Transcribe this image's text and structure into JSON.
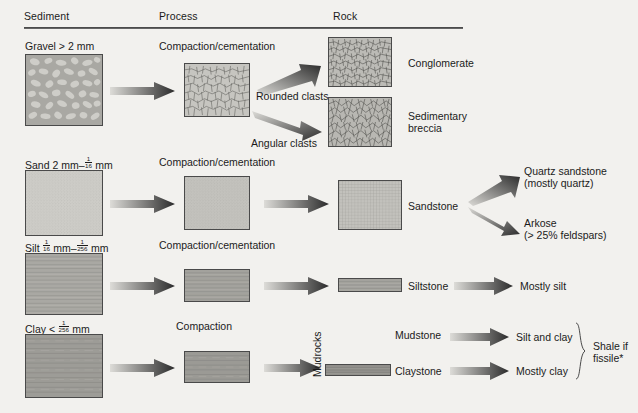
{
  "headers": [
    {
      "label": "Sediment"
    },
    {
      "label": "Process"
    },
    {
      "label": "Rock"
    }
  ],
  "rows": {
    "gravel": {
      "sediment_name": "Gravel",
      "sediment_size": "> 2 mm",
      "process": "Compaction/cementation",
      "branch_labels": [
        "Rounded clasts",
        "Angular clasts"
      ],
      "rocks": [
        "Conglomerate",
        "Sedimentary breccia"
      ]
    },
    "sand": {
      "sediment_name": "Sand",
      "sediment_size_pre": "2 mm–",
      "sediment_frac_num": "1",
      "sediment_frac_den": "16",
      "sediment_size_post": "mm",
      "process": "Compaction/cementation",
      "rock": "Sandstone",
      "products": [
        {
          "line1": "Quartz sandstone",
          "line2": "(mostly quartz)"
        },
        {
          "line1": "Arkose",
          "line2": "(> 25% feldspars)"
        }
      ]
    },
    "silt": {
      "sediment_name": "Silt",
      "frac1_num": "1",
      "frac1_den": "16",
      "mid": "mm–",
      "frac2_num": "1",
      "frac2_den": "256",
      "tail": "mm",
      "process": "Compaction/cementation",
      "rock": "Siltstone",
      "product": "Mostly silt"
    },
    "clay": {
      "sediment_name": "Clay",
      "lt": "<",
      "frac_num": "1",
      "frac_den": "256",
      "tail": "mm",
      "process": "Compaction",
      "rocks": [
        {
          "name": "Mudstone",
          "product": "Silt and clay"
        },
        {
          "name": "Claystone",
          "product": "Mostly clay"
        }
      ],
      "group_label": "Mudrocks",
      "brace_label_line1": "Shale if",
      "brace_label_line2": "fissile*"
    }
  },
  "colors": {
    "background": "#f2f1ee",
    "box_fill_light": "#c9c8c4",
    "box_fill_mid": "#b3b2ad",
    "box_fill_dark": "#9a9994",
    "box_border": "#4a4a4a",
    "arrow_dark": "#2f2f2f",
    "arrow_light": "#d8d7d3",
    "text": "#1b1b1b",
    "rule": "#3a3a3a"
  }
}
